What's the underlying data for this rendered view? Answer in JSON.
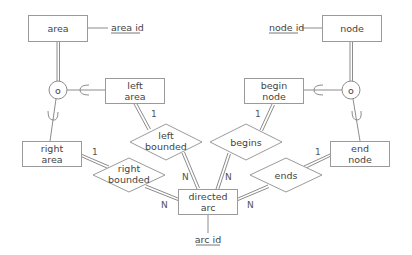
{
  "diagram": {
    "type": "entity-relationship",
    "entities": {
      "area": {
        "label": "area"
      },
      "left_area": {
        "label1": "left",
        "label2": "area"
      },
      "right_area": {
        "label1": "right",
        "label2": "area"
      },
      "node": {
        "label": "node"
      },
      "begin_node": {
        "label1": "begin",
        "label2": "node"
      },
      "end_node": {
        "label1": "end",
        "label2": "node"
      },
      "directed_arc": {
        "label1": "directed",
        "label2": "arc"
      }
    },
    "attributes": {
      "area_id": {
        "label": "area id",
        "key": true
      },
      "node_id": {
        "label": "node id",
        "key": true
      },
      "arc_id": {
        "label": "arc id",
        "key": true
      }
    },
    "relationships": {
      "left_bounded": {
        "label1": "left",
        "label2": "bounded"
      },
      "right_bounded": {
        "label1": "right",
        "label2": "bounded"
      },
      "begins": {
        "label": "begins"
      },
      "ends": {
        "label": "ends"
      }
    },
    "specializations": {
      "area_split": {
        "symbol": "o",
        "parent": "area",
        "children": [
          "left area",
          "right area"
        ]
      },
      "node_split": {
        "symbol": "o",
        "parent": "node",
        "children": [
          "begin node",
          "end node"
        ]
      }
    },
    "cardinalities": {
      "left_area_left_bounded": "1",
      "right_area_right_bounded": "1",
      "begin_node_begins": "1",
      "end_node_ends": "1",
      "left_bounded_arc": "N",
      "right_bounded_arc": "N",
      "begins_arc": "N",
      "ends_arc": "N"
    }
  }
}
